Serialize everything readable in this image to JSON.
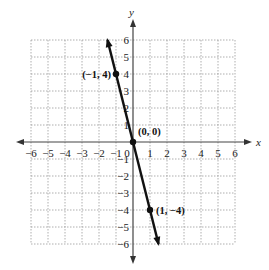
{
  "chart_data": {
    "type": "line",
    "title": "",
    "xlabel": "x",
    "ylabel": "y",
    "xlim": [
      -6,
      6
    ],
    "ylim": [
      -6,
      6
    ],
    "grid": true,
    "grid_style": "dotted",
    "x_ticks": [
      "-6",
      "-5",
      "-4",
      "-3",
      "-2",
      "-1",
      "1",
      "2",
      "3",
      "4",
      "5",
      "6"
    ],
    "y_ticks": [
      "6",
      "5",
      "4",
      "3",
      "2",
      "1",
      "-1",
      "-2",
      "-3",
      "-4",
      "-5",
      "-6"
    ],
    "origin_tick": "0",
    "series": [
      {
        "name": "y = -4x",
        "equation": "y = -4x",
        "x": [
          -1.5,
          1.5
        ],
        "y": [
          6,
          -6
        ],
        "color": "#111111",
        "arrows": "both"
      }
    ],
    "points": [
      {
        "x": -1,
        "y": 4,
        "label": "(−1, 4)"
      },
      {
        "x": 0,
        "y": 0,
        "label": "(0, 0)"
      },
      {
        "x": 1,
        "y": -4,
        "label": "(1, −4)"
      }
    ]
  }
}
